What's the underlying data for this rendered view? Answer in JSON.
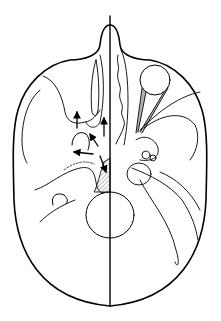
{
  "diagram": {
    "title": "",
    "stroke_color": "#000000",
    "background": "#ffffff",
    "labels": []
  }
}
